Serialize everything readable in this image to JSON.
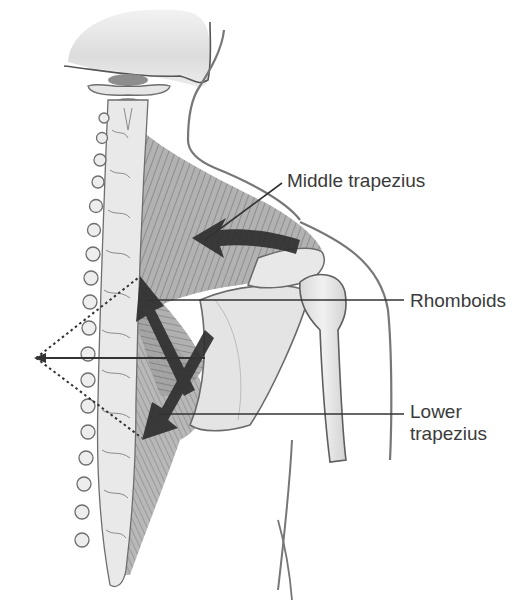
{
  "figure": {
    "labels": {
      "middle_trapezius": "Middle trapezius",
      "rhomboids": "Rhomboids",
      "lower_trapezius_line1": "Lower",
      "lower_trapezius_line2": "trapezius"
    },
    "colors": {
      "background": "#ffffff",
      "label_text": "#3a3a3a",
      "leader_line": "#333333",
      "arrow_fill": "#2f2f2f",
      "bone_fill": "#e6e6e6",
      "bone_outline": "#6e6e6e",
      "muscle_fill": "#9a9a9a",
      "skin_outline": "#777777"
    },
    "force_vector": {
      "style": "dotted parallelogram with resultant arrow pointing left",
      "resultant_direction": "medial (left)"
    }
  }
}
